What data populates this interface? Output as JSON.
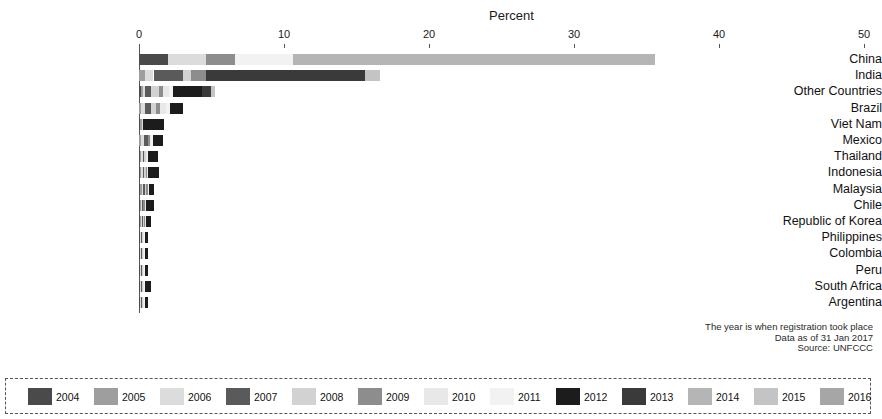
{
  "chart_data": {
    "type": "bar",
    "orientation": "horizontal",
    "stacked": true,
    "title": "",
    "xlabel": "Percent",
    "ylabel": "",
    "xlim": [
      0,
      50
    ],
    "xticks": [
      0,
      10,
      20,
      30,
      40,
      50
    ],
    "grid": false,
    "legend_position": "bottom",
    "categories": [
      "China",
      "India",
      "Other Countries",
      "Brazil",
      "Viet Nam",
      "Mexico",
      "Thailand",
      "Indonesia",
      "Malaysia",
      "Chile",
      "Republic of Korea",
      "Philippines",
      "Colombia",
      "Peru",
      "South Africa",
      "Argentina"
    ],
    "series": [
      {
        "name": "2004",
        "values": [
          2.0,
          0.0,
          0.15,
          0.0,
          0.1,
          0.0,
          0.1,
          0.1,
          0.1,
          0.1,
          0.1,
          0.05,
          0.05,
          0.05,
          0.05,
          0.05
        ]
      },
      {
        "name": "2005",
        "values": [
          0.0,
          0.4,
          0.1,
          0.15,
          0.1,
          0.15,
          0.05,
          0.05,
          0.1,
          0.05,
          0.05,
          0.05,
          0.05,
          0.05,
          0.05,
          0.05
        ]
      },
      {
        "name": "2006",
        "values": [
          2.6,
          0.6,
          0.15,
          0.25,
          0.1,
          0.2,
          0.1,
          0.1,
          0.1,
          0.05,
          0.05,
          0.05,
          0.05,
          0.05,
          0.05,
          0.05
        ]
      },
      {
        "name": "2007",
        "values": [
          0.0,
          2.0,
          0.45,
          0.45,
          0.0,
          0.3,
          0.1,
          0.1,
          0.1,
          0.05,
          0.1,
          0.05,
          0.05,
          0.05,
          0.05,
          0.05
        ]
      },
      {
        "name": "2008",
        "values": [
          0.0,
          0.6,
          0.5,
          0.3,
          0.0,
          0.0,
          0.1,
          0.1,
          0.1,
          0.05,
          0.05,
          0.05,
          0.05,
          0.05,
          0.05,
          0.05
        ]
      },
      {
        "name": "2009",
        "values": [
          2.0,
          1.0,
          0.3,
          0.3,
          0.0,
          0.1,
          0.05,
          0.1,
          0.1,
          0.1,
          0.05,
          0.05,
          0.05,
          0.05,
          0.05,
          0.05
        ]
      },
      {
        "name": "2010",
        "values": [
          0.0,
          0.0,
          0.4,
          0.4,
          0.0,
          0.1,
          0.05,
          0.05,
          0.05,
          0.05,
          0.05,
          0.05,
          0.05,
          0.05,
          0.05,
          0.05
        ]
      },
      {
        "name": "2011",
        "values": [
          4.0,
          0.0,
          0.3,
          0.3,
          0.0,
          0.1,
          0.05,
          0.05,
          0.05,
          0.05,
          0.05,
          0.05,
          0.05,
          0.05,
          0.05,
          0.05
        ]
      },
      {
        "name": "2012",
        "values": [
          0.0,
          0.0,
          2.0,
          0.9,
          1.4,
          0.7,
          0.7,
          0.7,
          0.35,
          0.55,
          0.3,
          0.2,
          0.2,
          0.2,
          0.4,
          0.2
        ]
      },
      {
        "name": "2013",
        "values": [
          0.0,
          11.0,
          0.6,
          0.0,
          0.0,
          0.0,
          0.0,
          0.0,
          0.0,
          0.0,
          0.0,
          0.0,
          0.0,
          0.0,
          0.0,
          0.0
        ]
      },
      {
        "name": "2014",
        "values": [
          25.0,
          0.0,
          0.0,
          0.0,
          0.0,
          0.0,
          0.0,
          0.0,
          0.0,
          0.0,
          0.0,
          0.0,
          0.0,
          0.0,
          0.0,
          0.0
        ]
      },
      {
        "name": "2015",
        "values": [
          0.0,
          1.0,
          0.3,
          0.0,
          0.0,
          0.0,
          0.0,
          0.0,
          0.0,
          0.0,
          0.0,
          0.0,
          0.0,
          0.0,
          0.0,
          0.0
        ]
      },
      {
        "name": "2016",
        "values": [
          0.0,
          0.0,
          0.0,
          0.0,
          0.0,
          0.0,
          0.0,
          0.0,
          0.0,
          0.0,
          0.0,
          0.0,
          0.0,
          0.0,
          0.0,
          0.0
        ]
      }
    ],
    "totals": [
      49.6,
      21.0,
      8.2,
      6.2,
      3.6,
      2.5,
      2.0,
      1.9,
      1.5,
      1.4,
      1.1,
      0.8,
      0.75,
      0.7,
      0.9,
      0.65
    ],
    "annotations": [
      "The year is when registration took place",
      "Data as of 31 Jan 2017",
      "Source: UNFCCC"
    ]
  },
  "colors": {
    "2004": "#4a4a4a",
    "2005": "#9e9e9e",
    "2006": "#dcdcdc",
    "2007": "#5a5a5a",
    "2008": "#d2d2d2",
    "2009": "#8d8d8d",
    "2010": "#e8e8e8",
    "2011": "#f2f2f2",
    "2012": "#1c1c1c",
    "2013": "#3a3a3a",
    "2014": "#b5b5b5",
    "2015": "#c4c4c4",
    "2016": "#a6a6a6",
    "axis": "#555555",
    "text": "#111111"
  },
  "legend": {
    "items": [
      {
        "label": "2004",
        "color_key": "2004"
      },
      {
        "label": "2005",
        "color_key": "2005"
      },
      {
        "label": "2006",
        "color_key": "2006"
      },
      {
        "label": "2007",
        "color_key": "2007"
      },
      {
        "label": "2008",
        "color_key": "2008"
      },
      {
        "label": "2009",
        "color_key": "2009"
      },
      {
        "label": "2010",
        "color_key": "2010"
      },
      {
        "label": "2011",
        "color_key": "2011"
      },
      {
        "label": "2012",
        "color_key": "2012"
      },
      {
        "label": "2013",
        "color_key": "2013"
      },
      {
        "label": "2014",
        "color_key": "2014"
      },
      {
        "label": "2015",
        "color_key": "2015"
      },
      {
        "label": "2016",
        "color_key": "2016"
      }
    ]
  },
  "layout": {
    "plot_left": 139,
    "plot_right": 864,
    "row_top": 54,
    "row_step": 16.2,
    "bar_height": 11,
    "label_right_edge": 133,
    "axis_y": 48,
    "tick_label_y": 28,
    "axis_title_x": 489,
    "axis_title_y": 8,
    "note_top": 322,
    "legend_item_x": [
      22,
      88,
      154,
      220,
      286,
      352,
      418,
      484,
      550,
      616,
      682,
      748,
      814
    ],
    "legend_fallback_step": 66
  }
}
